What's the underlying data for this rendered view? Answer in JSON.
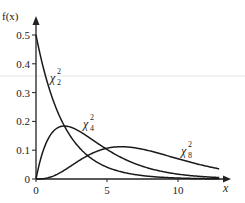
{
  "chart_data": {
    "type": "line",
    "title": "",
    "xlabel": "x",
    "ylabel": "f(x)",
    "xlim": [
      0,
      13
    ],
    "ylim": [
      0,
      0.5
    ],
    "grid": false,
    "legend": "inline labels",
    "x_ticks": [
      "0",
      "5",
      "10"
    ],
    "y_ticks": [
      "0",
      "0.1",
      "0.2",
      "0.3",
      "0.4",
      "0.5"
    ],
    "x": [
      0,
      0.5,
      1,
      1.5,
      2,
      2.5,
      3,
      3.5,
      4,
      5,
      6,
      7,
      8,
      9,
      10,
      11,
      12,
      12.9
    ],
    "series": [
      {
        "name": "χ²₂",
        "label_main": "χ",
        "label_sub": "2",
        "label_sup": "2",
        "values": [
          0.5,
          0.389,
          0.303,
          0.236,
          0.184,
          0.143,
          0.112,
          0.087,
          0.068,
          0.041,
          0.025,
          0.015,
          0.009,
          0.006,
          0.003,
          0.002,
          0.001,
          0.001
        ]
      },
      {
        "name": "χ²₄",
        "label_main": "χ",
        "label_sub": "4",
        "label_sup": "2",
        "values": [
          0,
          0.097,
          0.152,
          0.177,
          0.184,
          0.179,
          0.167,
          0.152,
          0.135,
          0.103,
          0.075,
          0.053,
          0.037,
          0.025,
          0.017,
          0.011,
          0.007,
          0.005
        ]
      },
      {
        "name": "χ²₈",
        "label_main": "χ",
        "label_sub": "8",
        "label_sup": "2",
        "values": [
          0,
          0.001,
          0.006,
          0.017,
          0.031,
          0.047,
          0.063,
          0.076,
          0.09,
          0.107,
          0.112,
          0.107,
          0.098,
          0.084,
          0.07,
          0.057,
          0.045,
          0.036
        ]
      }
    ]
  },
  "axes": {
    "y_label": "f(x)",
    "x_label": "x"
  }
}
